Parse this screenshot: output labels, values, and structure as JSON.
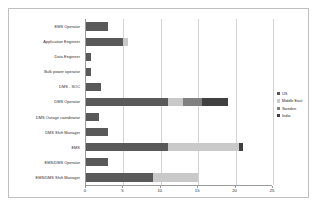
{
  "chart_data": {
    "type": "bar",
    "orientation": "horizontal",
    "stacked": true,
    "title": "",
    "xlabel": "",
    "ylabel": "",
    "xlim": [
      0,
      25
    ],
    "xticks": [
      0,
      5,
      10,
      15,
      20,
      25
    ],
    "grid": true,
    "legend_position": "right",
    "categories": [
      "EMS Operator",
      "Application Engineer",
      "Data Engineer",
      "Bulk power operator",
      "DMS - SOC",
      "DMS Operator",
      "DMS Outage coordinator",
      "DMS Shift Manager",
      "EMS",
      "EMS/DMS Operator",
      "EMS/DMS Shift Manager"
    ],
    "series": [
      {
        "name": "US",
        "color": "#595959",
        "values": [
          3,
          5,
          0.7,
          0.7,
          2,
          11,
          1.8,
          3,
          11,
          3,
          9
        ]
      },
      {
        "name": "Middle East",
        "color": "#c9c9c9",
        "values": [
          0,
          0.6,
          0,
          0,
          0,
          2,
          0,
          0,
          9.5,
          0,
          6
        ]
      },
      {
        "name": "Sweden",
        "color": "#808080",
        "values": [
          0,
          0,
          0,
          0,
          0,
          2.5,
          0,
          0,
          0,
          0,
          0
        ]
      },
      {
        "name": "India",
        "color": "#404040",
        "values": [
          0,
          0,
          0,
          0,
          0,
          3.5,
          0,
          0,
          0.5,
          0,
          0
        ]
      }
    ],
    "totals": [
      3,
      5.6,
      0.7,
      0.7,
      2,
      19,
      1.8,
      3,
      21,
      3,
      15
    ]
  },
  "legend": {
    "entries": [
      {
        "label": "US",
        "color": "#595959"
      },
      {
        "label": "Middle East",
        "color": "#c9c9c9"
      },
      {
        "label": "Sweden",
        "color": "#808080"
      },
      {
        "label": "India",
        "color": "#404040"
      }
    ]
  }
}
